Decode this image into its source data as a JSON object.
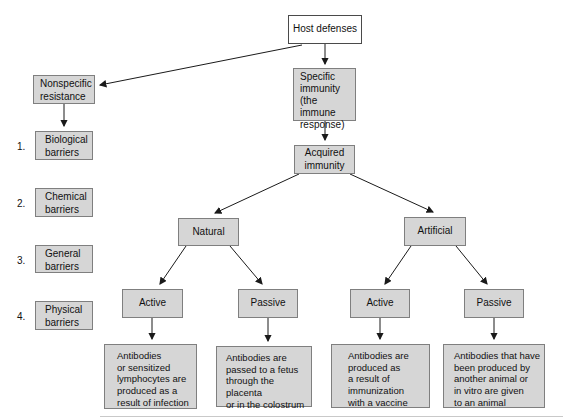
{
  "diagram": {
    "nodes": {
      "host_defenses": {
        "label": "Host defenses"
      },
      "nonspecific": {
        "label": "Nonspecific\nresistance"
      },
      "specific": {
        "label": "Specific\nimmunity\n(the immune\nresponse)"
      },
      "acquired": {
        "label": "Acquired\nimmunity"
      },
      "natural": {
        "label": "Natural"
      },
      "artificial": {
        "label": "Artificial"
      },
      "natural_active": {
        "label": "Active"
      },
      "natural_passive": {
        "label": "Passive"
      },
      "artificial_active": {
        "label": "Active"
      },
      "artificial_passive": {
        "label": "Passive"
      },
      "natural_active_desc": {
        "label": "Antibodies\nor sensitized\nlymphocytes are\nproduced as a\nresult of infection"
      },
      "natural_passive_desc": {
        "label": "Antibodies are\npassed to a fetus\nthrough the placenta\nor in the colostrum"
      },
      "artificial_active_desc": {
        "label": "Antibodies are\nproduced as\na result of\nimmunization\nwith a vaccine"
      },
      "artificial_passive_desc": {
        "label": "Antibodies that have\nbeen produced by\nanother animal or\nin vitro are given\nto an animal"
      }
    },
    "barriers": [
      {
        "number": "1.",
        "label": "Biological\nbarriers"
      },
      {
        "number": "2.",
        "label": "Chemical\nbarriers"
      },
      {
        "number": "3.",
        "label": "General\nbarriers"
      },
      {
        "number": "4.",
        "label": "Physical\nbarriers"
      }
    ],
    "colors": {
      "background": "#ffffff",
      "box_fill": "#d6d6d6",
      "box_border": "#7f7f7f",
      "root_fill": "#ffffff",
      "root_border": "#4a4a4a",
      "line": "#1a1a1a",
      "text": "#111111",
      "rule": "#c9c9c9"
    }
  }
}
